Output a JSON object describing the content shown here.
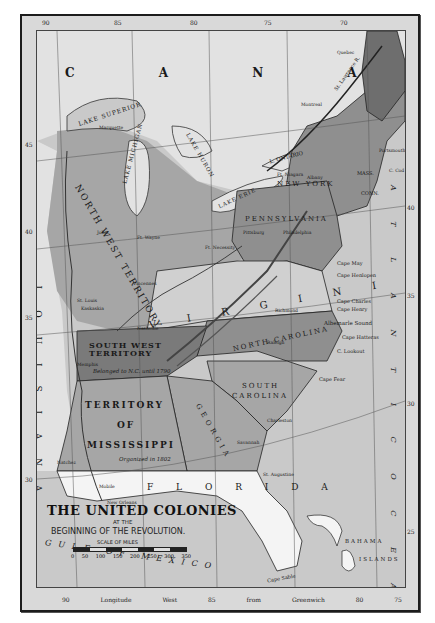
{
  "map": {
    "title": "THE UNITED COLONIES",
    "subtitle_line1": "AT THE",
    "subtitle_line2": "BEGINNING OF THE REVOLUTION.",
    "scale": {
      "title": "SCALE OF MILES",
      "ticks": [
        "0",
        "50",
        "100",
        "150",
        "200",
        "250",
        "300",
        "350"
      ]
    },
    "longitude_top": [
      "90",
      "85",
      "80",
      "75",
      "70"
    ],
    "longitude_bottom": [
      "90",
      "Longitude",
      "West",
      "85",
      "from",
      "Greenwich",
      "80",
      "75"
    ],
    "latitude_left": [
      "45",
      "40",
      "35",
      "30"
    ],
    "latitude_right": [
      "40",
      "35",
      "30",
      "25"
    ],
    "regions": {
      "canada": "C A N A D A",
      "northwest": "NORTH WEST TERRITORY",
      "louisiana": "L O U I S I A N A",
      "virginia": "V I R G I N I A",
      "southwest": "SOUTH WEST TERRITORY",
      "southwest_note": "Belonged to N.C. until 1790",
      "mississippi_1": "TERRITORY",
      "mississippi_2": "OF",
      "mississippi_3": "MISSISSIPPI",
      "mississippi_note": "Organized in 1802",
      "north_carolina": "NORTH CAROLINA",
      "south_carolina_1": "SOUTH",
      "south_carolina_2": "CAROLINA",
      "georgia": "GEORGIA",
      "florida": "F L O R I D A",
      "pennsylvania": "PENNSYLVANIA",
      "new_york": "NEW YORK",
      "mass": "MASS.",
      "conn": "CONN.",
      "maine": "MAINE (MASS.)",
      "new_hampshire": "N.H.",
      "vermont": "VT.",
      "rhode_island": "R.I."
    },
    "water": {
      "lake_superior": "LAKE SUPERIOR",
      "lake_michigan": "LAKE MICHIGAN",
      "lake_huron": "LAKE HURON",
      "lake_erie": "LAKE ERIE",
      "lake_ontario": "L. ONTARIO",
      "gulf": "GULF OF MEXICO",
      "atlantic": "A T L A N T I C   O C E A N",
      "st_lawrence": "St. Lawrence R.",
      "mississippi_r": "Mississippi R.",
      "ohio_r": "Ohio R.",
      "albemarle": "Albemarle Sound",
      "delaware_bay": "Delaware Bay"
    },
    "places": {
      "quebec": "Quebec",
      "montreal": "Montreal",
      "marquette": "Marquette",
      "joliet": "Joliet",
      "ft_wayne": "Ft. Wayne",
      "vincennes": "Vincennes",
      "st_louis": "St. Louis",
      "kaskaskia": "Kaskaskia",
      "ft_niagara": "Ft. Niagara",
      "ft_necessity": "Ft. Necessity",
      "albany": "Albany",
      "pittsburg": "Pittsburg",
      "philadelphia": "Philadelphia",
      "new_york_city": "New York",
      "portsmouth": "Portsmouth",
      "cape_cod": "C. Cod",
      "hartford": "Hartford",
      "richmond": "Richmond",
      "raleigh": "Raleigh",
      "nashville": "Nashville",
      "memphis": "Memphis",
      "natchez": "Natchez",
      "mobile": "Mobile",
      "pensacola": "Pensacola",
      "new_orleans": "New Orleans",
      "charleston": "Charleston",
      "savannah": "Savannah",
      "augusta": "Augusta",
      "st_augustine": "St. Augustine",
      "cape_may": "Cape May",
      "cape_henlopen": "Cape Henlopen",
      "cape_charles": "Cape Charles",
      "cape_henry": "Cape Henry",
      "cape_hatteras": "Cape Hatteras",
      "cape_lookout": "C. Lookout",
      "cape_fear": "Cape Fear",
      "cape_sable": "Cape Sable",
      "bahama": "BAHAMA",
      "islands": "ISLANDS",
      "long_island": "LONG ISLAND"
    },
    "colors": {
      "paper": "#d9d9d9",
      "water": "#c9c9c9",
      "colony_dark": "#6e6e6e",
      "colony_mid": "#8f8f8f",
      "territory": "#a6a6a6",
      "land_light": "#e2e2e2",
      "florida": "#f4f4f4"
    }
  }
}
